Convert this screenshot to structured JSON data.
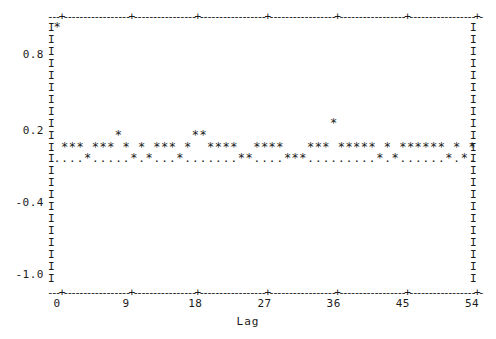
{
  "chart_data": {
    "type": "line",
    "title": "",
    "subtitle": "",
    "xlabel": "Lag",
    "ylabel": "",
    "grid": false,
    "legend": "none",
    "style": "ascii-character-plot",
    "xlim": [
      0,
      54
    ],
    "ylim": [
      -1.0,
      1.0
    ],
    "xticks": [
      0,
      9,
      18,
      27,
      36,
      45,
      54
    ],
    "xtick_labels": [
      "0",
      "9",
      "18",
      "27",
      "36",
      "45",
      "54"
    ],
    "yticks": [
      0.8,
      0.2,
      -0.4,
      -1.0
    ],
    "ytick_labels": [
      "0.8",
      "0.2",
      "-0.4",
      "-1.0"
    ],
    "x": [
      0,
      1,
      2,
      3,
      4,
      5,
      6,
      7,
      8,
      9,
      10,
      11,
      12,
      13,
      14,
      15,
      16,
      17,
      18,
      19,
      20,
      21,
      22,
      23,
      24,
      25,
      26,
      27,
      28,
      29,
      30,
      31,
      32,
      33,
      34,
      35,
      36,
      37,
      38,
      39,
      40,
      41,
      42,
      43,
      44,
      45,
      46,
      47,
      48,
      49,
      50,
      51,
      52,
      53,
      54
    ],
    "values": [
      1.0,
      0.02,
      0.06,
      0.06,
      -0.06,
      0.02,
      0.02,
      0.02,
      0.14,
      0.02,
      -0.06,
      0.02,
      -0.06,
      0.06,
      0.02,
      0.06,
      -0.06,
      0.02,
      0.14,
      0.14,
      0.06,
      0.02,
      0.02,
      0.02,
      -0.06,
      -0.06,
      0.02,
      0.06,
      0.06,
      0.02,
      -0.06,
      -0.06,
      -0.06,
      0.06,
      0.06,
      0.06,
      0.22,
      0.06,
      0.06,
      0.06,
      0.06,
      0.02,
      -0.06,
      0.06,
      -0.06,
      0.06,
      0.06,
      0.06,
      0.06,
      0.06,
      0.02,
      -0.06,
      0.02,
      -0.06,
      0.02
    ],
    "series": [
      {
        "name": "autocorrelation",
        "marker": "*",
        "values": [
          1.0,
          0.02,
          0.06,
          0.06,
          -0.06,
          0.02,
          0.02,
          0.02,
          0.14,
          0.02,
          -0.06,
          0.02,
          -0.06,
          0.06,
          0.02,
          0.06,
          -0.06,
          0.02,
          0.14,
          0.14,
          0.06,
          0.02,
          0.02,
          0.02,
          -0.06,
          -0.06,
          0.02,
          0.06,
          0.06,
          0.02,
          -0.06,
          -0.06,
          -0.06,
          0.06,
          0.06,
          0.06,
          0.22,
          0.06,
          0.06,
          0.06,
          0.06,
          0.02,
          -0.06,
          0.06,
          -0.06,
          0.06,
          0.06,
          0.06,
          0.06,
          0.06,
          0.02,
          -0.06,
          0.02,
          -0.06,
          0.02
        ]
      }
    ]
  },
  "axes": {
    "ylabels": [
      "0.8",
      "0.2",
      "-0.4",
      "-1.0"
    ],
    "xtick_labels": [
      "0",
      "9",
      "18",
      "27",
      "36",
      "45",
      "54"
    ],
    "xaxis_title": "Lag",
    "border_glyph": "I",
    "frame_dash_glyph": "-",
    "frame_tick_glyph": "+",
    "marker_glyph": "*",
    "baseline_glyph": "."
  },
  "colors": {
    "ink": "#1a1a1a",
    "background": "#ffffff"
  }
}
